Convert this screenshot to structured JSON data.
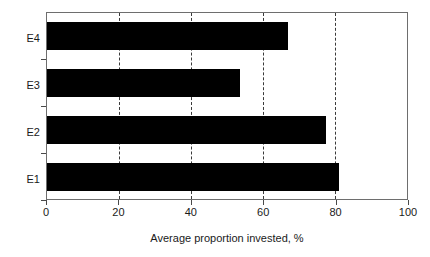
{
  "chart_data": {
    "type": "bar",
    "orientation": "horizontal",
    "title": "",
    "subtitle": "",
    "xlabel": "Average proportion invested, %",
    "ylabel": "",
    "categories": [
      "E1",
      "E2",
      "E3",
      "E4"
    ],
    "values": [
      81,
      77.5,
      53.5,
      67
    ],
    "series": [
      {
        "name": "Average proportion invested",
        "values": [
          81,
          77.5,
          53.5,
          67
        ]
      }
    ],
    "xlim": [
      0,
      100
    ],
    "xticks": [
      0,
      20,
      40,
      60,
      80,
      100
    ],
    "xtick_labels": [
      "0",
      "20",
      "40",
      "60",
      "80",
      "100"
    ],
    "gridlines": [
      20,
      40,
      60,
      80
    ],
    "grid": true,
    "grid_style": "dashed",
    "legend": false,
    "legend_position": "none",
    "bar_color": "#000000",
    "background_color": "#ffffff",
    "frame_color": "#6e6e6e",
    "annotations": []
  },
  "axis": {
    "x_title": "Average proportion invested, %"
  }
}
